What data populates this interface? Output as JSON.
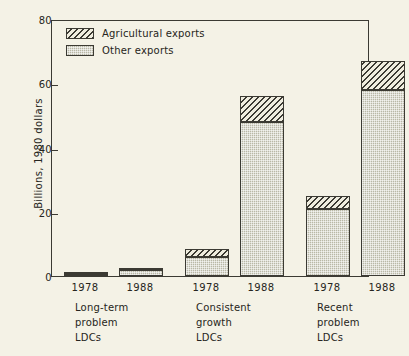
{
  "chart_data": {
    "type": "bar",
    "title": "",
    "subtitle": "",
    "xlabel": "",
    "ylabel": "Billions, 1980 dollars",
    "ylim": [
      0,
      80
    ],
    "yticks": [
      0,
      20,
      40,
      60,
      80
    ],
    "ytick_labels": [
      "0",
      "20",
      "40",
      "60",
      "80"
    ],
    "grid": false,
    "stacked": true,
    "legend_position": "top-left",
    "legend": [
      {
        "name": "Agricultural exports",
        "pattern": "diagonal-hatch",
        "color": "#efeddf"
      },
      {
        "name": "Other exports",
        "pattern": "solid-gray",
        "color": "#b9b8a6"
      }
    ],
    "categories": [
      "1978",
      "1988",
      "1978",
      "1988",
      "1978",
      "1988"
    ],
    "groups": [
      {
        "label_lines": [
          "Long-term",
          "problem",
          "LDCs"
        ],
        "label": "Long-term problem LDCs",
        "bars": [
          {
            "year": "1978",
            "other_exports": 0.5,
            "agricultural_exports": 0.2,
            "total": 0.7
          },
          {
            "year": "1988",
            "other_exports": 2.0,
            "agricultural_exports": 0.6,
            "total": 2.6
          }
        ]
      },
      {
        "label_lines": [
          "Consistent",
          "growth",
          "LDCs"
        ],
        "label": "Consistent growth LDCs",
        "bars": [
          {
            "year": "1978",
            "other_exports": 6.0,
            "agricultural_exports": 2.5,
            "total": 8.5
          },
          {
            "year": "1988",
            "other_exports": 48.0,
            "agricultural_exports": 8.0,
            "total": 56.0
          }
        ]
      },
      {
        "label_lines": [
          "Recent",
          "problem",
          "LDCs"
        ],
        "label": "Recent problem LDCs",
        "bars": [
          {
            "year": "1978",
            "other_exports": 21.0,
            "agricultural_exports": 4.0,
            "total": 25.0
          },
          {
            "year": "1988",
            "other_exports": 58.0,
            "agricultural_exports": 9.0,
            "total": 67.0
          }
        ]
      }
    ],
    "series": [
      {
        "name": "Other exports",
        "values": [
          0.5,
          2.0,
          6.0,
          48.0,
          21.0,
          58.0
        ]
      },
      {
        "name": "Agricultural exports",
        "values": [
          0.2,
          0.6,
          2.5,
          8.0,
          4.0,
          9.0
        ]
      }
    ]
  },
  "colors": {
    "background": "#f4f2e6",
    "ink": "#3b3a33",
    "other_exports": "#b9b8a6",
    "agricultural_exports": "#efeddf"
  }
}
